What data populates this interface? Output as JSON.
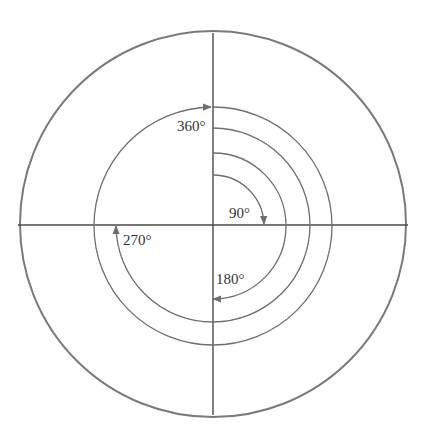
{
  "diagram": {
    "type": "rotation-angles-circle",
    "colors": {
      "outer_circle": "#7a7a7a",
      "axes": "#4a4a4a",
      "arcs": "#6e6e6e",
      "text": "#333333"
    },
    "center": [
      213,
      226
    ],
    "outer_radius": 192,
    "arcs": [
      {
        "degrees": 90,
        "radius": 51,
        "label": "90°"
      },
      {
        "degrees": 180,
        "radius": 73,
        "label": "180°"
      },
      {
        "degrees": 270,
        "radius": 97,
        "label": "270°"
      },
      {
        "degrees": 360,
        "radius": 119,
        "label": "360°"
      }
    ]
  },
  "labels": {
    "deg90": "90°",
    "deg180": "180°",
    "deg270": "270°",
    "deg360": "360°"
  }
}
